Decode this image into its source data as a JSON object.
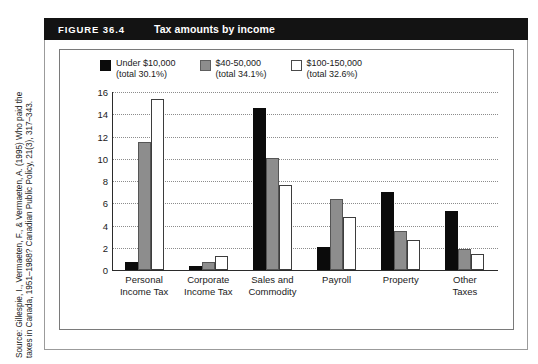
{
  "figure": {
    "number": "FIGURE 36.4",
    "title": "Tax amounts by income"
  },
  "source": {
    "line1": "Source: Gillespie, I., Vermaeten, F., & Vermaeten, A. (1995) Who paid the",
    "line2": "taxes in Canada, 1951–1988? Canadian Public Policy, 21(3), 317–343."
  },
  "colors": {
    "series_black": "#0b0b0b",
    "series_gray": "#8d8d8d",
    "series_white": "#ffffff",
    "header_bg": "#131313",
    "header_text": "#ffffff",
    "gridline": "#8c8c8c",
    "axis": "#2b2b2b"
  },
  "legend": [
    {
      "swatch": "black",
      "line1": "Under $10,000",
      "line2": "(total 30.1%)"
    },
    {
      "swatch": "gray",
      "line1": "$40-50,000",
      "line2": "(total 34.1%)"
    },
    {
      "swatch": "white",
      "line1": "$100-150,000",
      "line2": "(total 32.6%)"
    }
  ],
  "chart_data": {
    "type": "bar",
    "title": "Tax amounts by income",
    "xlabel": "",
    "ylabel": "",
    "ylim": [
      0,
      16
    ],
    "yticks": [
      0,
      2,
      4,
      6,
      8,
      10,
      12,
      14,
      16
    ],
    "grid": true,
    "legend_position": "top",
    "categories": [
      "Personal Income Tax",
      "Corporate Income Tax",
      "Sales and Commodity",
      "Payroll",
      "Property",
      "Other Taxes"
    ],
    "category_lines": [
      [
        "Personal",
        "Income Tax"
      ],
      [
        "Corporate",
        "Income Tax"
      ],
      [
        "Sales and",
        "Commodity"
      ],
      [
        "Payroll",
        ""
      ],
      [
        "Property",
        ""
      ],
      [
        "Other",
        "Taxes"
      ]
    ],
    "series": [
      {
        "name": "Under $10,000 (total 30.1%)",
        "swatch": "black",
        "values": [
          0.7,
          0.35,
          14.6,
          2.1,
          7.0,
          5.3
        ]
      },
      {
        "name": "$40-50,000 (total 34.1%)",
        "swatch": "gray",
        "values": [
          11.5,
          0.75,
          10.1,
          6.4,
          3.5,
          1.9
        ]
      },
      {
        "name": "$100-150,000 (total 32.6%)",
        "swatch": "white",
        "values": [
          15.4,
          1.3,
          7.6,
          4.8,
          2.7,
          1.4
        ]
      }
    ]
  }
}
